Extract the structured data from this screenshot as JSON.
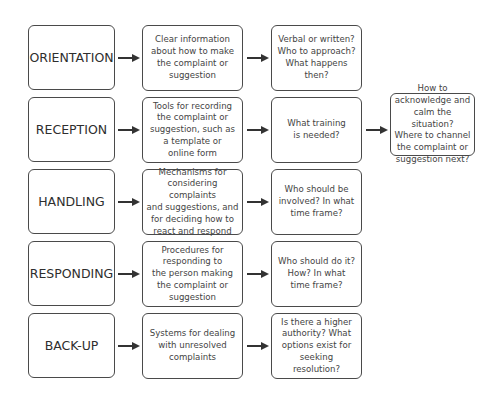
{
  "diagram": {
    "rows": [
      {
        "stage": "ORIENTATION",
        "description": "Clear information\nabout how to make\nthe complaint or\nsuggestion",
        "questions": "Verbal or written?\nWho to approach?\nWhat happens then?"
      },
      {
        "stage": "RECEPTION",
        "description": "Tools for recording\nthe complaint or\nsuggestion, such as\na template or\nonline form",
        "questions": "What training\nis needed?"
      },
      {
        "stage": "HANDLING",
        "description": "Mechanisms for\nconsidering complaints\nand suggestions, and\nfor deciding how to\nreact and respond",
        "questions": "Who should be\ninvolved? In what\ntime frame?"
      },
      {
        "stage": "RESPONDING",
        "description": "Procedures for\nresponding to\nthe person making\nthe complaint or\nsuggestion",
        "questions": "Who should do it?\nHow? In what\ntime frame?"
      },
      {
        "stage": "BACK-UP",
        "description": "Systems for dealing\nwith unresolved\ncomplaints",
        "questions": "Is there a higher\nauthority? What\noptions exist for\nseeking resolution?"
      }
    ],
    "reception_followup": "How to\nacknowledge and\ncalm the situation?\nWhere to channel\nthe complaint or\nsuggestion next?"
  }
}
